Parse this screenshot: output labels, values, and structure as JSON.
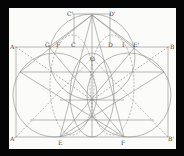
{
  "figure": {
    "type": "geometric-construction",
    "background": "#050505",
    "paper_color": "#fbfbf9",
    "line_color": "#8a8a8a",
    "labels": [
      {
        "text": "C'",
        "x": 67,
        "y": 16
      },
      {
        "text": "D'",
        "x": 109,
        "y": 16
      },
      {
        "text": "A",
        "x": 10,
        "y": 49
      },
      {
        "text": "G",
        "x": 45,
        "y": 47
      },
      {
        "text": "F",
        "x": 56,
        "y": 47
      },
      {
        "text": "C",
        "x": 71,
        "y": 47
      },
      {
        "text": "D",
        "x": 108,
        "y": 47
      },
      {
        "text": "I",
        "x": 122,
        "y": 47
      },
      {
        "text": "E'",
        "x": 133,
        "y": 47
      },
      {
        "text": "B",
        "x": 170,
        "y": 49
      },
      {
        "text": "O",
        "x": 90,
        "y": 61
      },
      {
        "text": "A'",
        "x": 10,
        "y": 141
      },
      {
        "text": "E",
        "x": 58,
        "y": 145
      },
      {
        "text": "F",
        "x": 121,
        "y": 145
      },
      {
        "text": "B'",
        "x": 168,
        "y": 141
      }
    ]
  }
}
